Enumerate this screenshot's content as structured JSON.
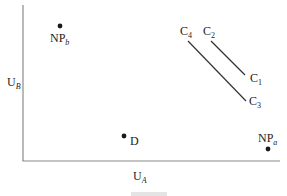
{
  "figure": {
    "axes": {
      "x_label": {
        "main": "U",
        "sub": "A"
      },
      "y_label": {
        "main": "U",
        "sub": "B"
      }
    },
    "points": [
      {
        "id": "NPb",
        "main": "NP",
        "sub": "b"
      },
      {
        "id": "D",
        "main": "D",
        "sub": ""
      },
      {
        "id": "NPa",
        "main": "NP",
        "sub": "a"
      }
    ],
    "curves": [
      {
        "id": "C2-C1",
        "start": {
          "main": "C",
          "sub": "2"
        },
        "end": {
          "main": "C",
          "sub": "1"
        }
      },
      {
        "id": "C4-C3",
        "start": {
          "main": "C",
          "sub": "4"
        },
        "end": {
          "main": "C",
          "sub": "3"
        }
      }
    ],
    "colors": {
      "ink": "#222222",
      "axis": "#888888"
    }
  }
}
